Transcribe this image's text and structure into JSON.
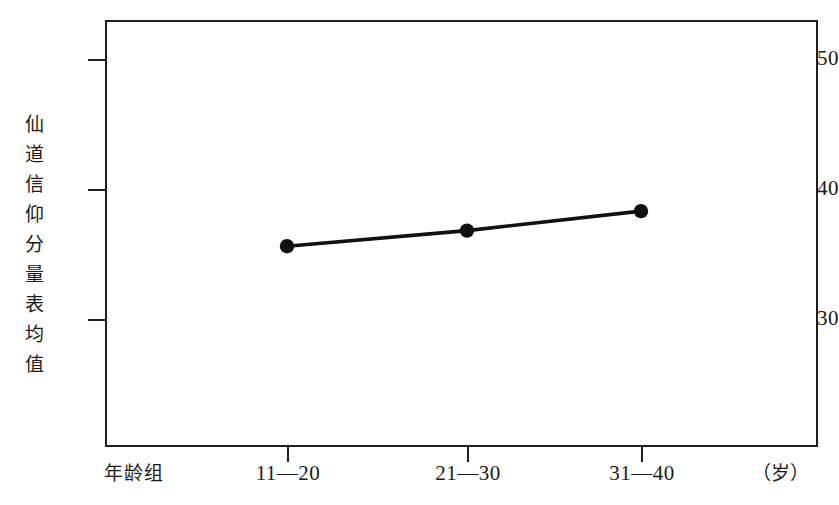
{
  "chart_data": {
    "type": "line",
    "title": "",
    "subtitle": "",
    "xlabel": "年龄组",
    "xunit": "（岁）",
    "ylabel": "仙道信仰分量表均值",
    "categories": [
      "11—20",
      "21—30",
      "31—40"
    ],
    "series": [
      {
        "name": "仙道信仰分量表均值",
        "values": [
          35.6,
          36.8,
          38.3
        ],
        "marker": "filled-circle",
        "color": "#111111"
      }
    ],
    "yticks": [
      30,
      40,
      50
    ],
    "ytick_labels": [
      "30",
      "40",
      "50"
    ],
    "ylim": [
      23.2,
      52.5
    ],
    "xlim": [
      0,
      4
    ],
    "grid": false,
    "legend": false,
    "legend_position": "none",
    "frame": true,
    "annotations": []
  },
  "axis": {
    "y_title_chars": [
      "仙",
      "道",
      "信",
      "仰",
      "分",
      "量",
      "表",
      "均",
      "值"
    ],
    "y_tick_labels": [
      "50",
      "40",
      "30"
    ],
    "x_tick_labels": [
      "11—20",
      "21—30",
      "31—40"
    ],
    "x_name": "年龄组",
    "x_unit": "（岁）"
  },
  "style": {
    "line_color": "#111111",
    "marker_color": "#111111",
    "frame_color": "#1f1f1f",
    "background": "#ffffff",
    "text_color": "#1a1a1a"
  }
}
